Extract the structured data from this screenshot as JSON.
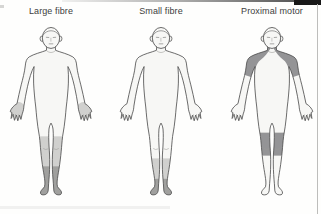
{
  "figures": [
    {
      "label": "Large fibre",
      "shaded_regions": [
        {
          "region": "hands",
          "intensity": "light"
        },
        {
          "region": "lower legs below the knee",
          "intensity": "light"
        },
        {
          "region": "ankles and feet (sock distribution)",
          "intensity": "dark"
        }
      ]
    },
    {
      "label": "Small fibre",
      "shaded_regions": [
        {
          "region": "lower calves and ankles",
          "intensity": "light"
        },
        {
          "region": "feet",
          "intensity": "dark"
        }
      ]
    },
    {
      "label": "Proximal motor",
      "shaded_regions": [
        {
          "region": "shoulders (deltoid area)",
          "intensity": "dark"
        },
        {
          "region": "lower thighs and knees",
          "intensity": "dark"
        }
      ]
    }
  ],
  "colors": {
    "shade_light": "#d0d0ce",
    "shade_dark": "#a0a09e",
    "shade_dark_motor": "#949496",
    "outline": "#4d4d4d",
    "body_fill": "#f7f7f5",
    "label_text": "#404040",
    "scan_bar": "#181818"
  }
}
